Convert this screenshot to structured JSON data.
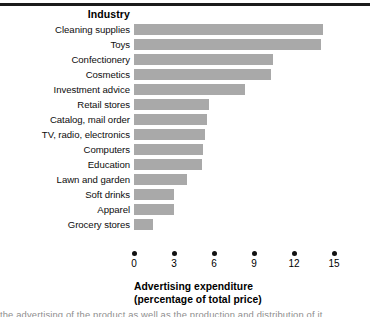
{
  "figure": {
    "category_axis_title": "Industry",
    "axis_title_line1": "Advertising expenditure",
    "axis_title_line2": "(percentage of total price)",
    "bar_color": "#a9a9a9",
    "tick_color": "#111111",
    "rule_color": "#1b1b1b"
  },
  "chart_data": {
    "type": "bar",
    "orientation": "horizontal",
    "title": "Industry",
    "xlabel": "Advertising expenditure (percentage of total price)",
    "ylabel": "Industry",
    "xlim": [
      0,
      15.6
    ],
    "xticks": [
      0,
      3,
      6,
      9,
      12,
      15
    ],
    "xtick_labels": [
      "0",
      "3",
      "6",
      "9",
      "12",
      "15"
    ],
    "grid": false,
    "legend": false,
    "categories": [
      "Cleaning supplies",
      "Toys",
      "Confectionery",
      "Cosmetics",
      "Investment advice",
      "Retail stores",
      "Catalog, mail order",
      "TV, radio, electronics",
      "Computers",
      "Education",
      "Lawn and garden",
      "Soft drinks",
      "Apparel",
      "Grocery stores"
    ],
    "values": [
      14.2,
      14.0,
      10.4,
      10.3,
      8.3,
      5.6,
      5.5,
      5.3,
      5.2,
      5.1,
      4.0,
      3.0,
      3.0,
      1.4
    ]
  },
  "footer": {
    "clipped_text": "the advertising of the product as well as the production and distribution of it"
  }
}
